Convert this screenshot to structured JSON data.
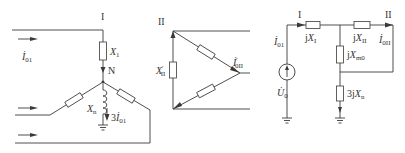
{
  "figure": {
    "wye_section": {
      "node_top_label": "I",
      "neutral_label": "N",
      "current_label": {
        "main": "İ",
        "sub": "01"
      },
      "reactance_top": {
        "main": "X",
        "sub": "1"
      },
      "neutral_reactance": {
        "main": "X",
        "sub": "n"
      },
      "neutral_current": {
        "prefix": "3",
        "main": "İ",
        "sub": "01"
      }
    },
    "delta_section": {
      "node_label": "II",
      "reactance_label": {
        "main": "X",
        "prime": "′",
        "sub": "II"
      },
      "current_label": {
        "main": "İ",
        "prime": "′",
        "sub": "0II"
      }
    },
    "equivalent_circuit": {
      "node_left_label": "I",
      "node_right_label": "II",
      "input_current": {
        "main": "İ",
        "sub": "01"
      },
      "output_current": {
        "main": "İ",
        "sub": "0II"
      },
      "source_label": {
        "main": "U̇",
        "sub": "0"
      },
      "series_left": {
        "prefix": "j",
        "main": "X",
        "sub": "I"
      },
      "series_right": {
        "prefix": "j",
        "main": "X",
        "sub": "II"
      },
      "shunt_top": {
        "prefix": "j",
        "main": "X",
        "sub": "m0"
      },
      "shunt_bottom": {
        "prefix": "3j",
        "main": "X",
        "sub": "n"
      }
    },
    "colors": {
      "stroke": "#3a3a3a",
      "text": "#333333",
      "background": "#ffffff"
    }
  }
}
